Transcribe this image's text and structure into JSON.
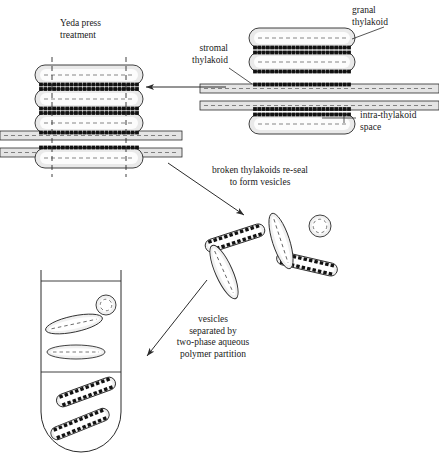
{
  "figure": {
    "background": "#ffffff",
    "stroke": "#2b2b2b",
    "fill_light": "#e9e9e9",
    "fill_lumen": "#fbfbfb",
    "complex_color": "#111111"
  },
  "labels": {
    "yeda_press": "Yeda press\ntreatment",
    "granal_thylakoid": "granal\nthylakoid",
    "stromal_thylakoid": "stromal\nthylakoid",
    "intra_thylakoid_space": "intra-thylakoid\nspace",
    "reseal": "broken thylakoids re-seal\nto form vesicles",
    "partition": "vesicles\nseparated by\ntwo-phase aqueous\npolymer partition"
  },
  "stacks": {
    "intact": {
      "name": "intact-granum-stack",
      "x": 255,
      "granal_discs": [
        {
          "id": "granal-disc-top",
          "cx": 302,
          "cy": 38,
          "w": 106,
          "h": 20
        },
        {
          "id": "granal-disc-second",
          "cx": 302,
          "cy": 62,
          "w": 106,
          "h": 20
        },
        {
          "id": "granal-disc-bottom",
          "cx": 302,
          "cy": 124,
          "w": 106,
          "h": 20
        }
      ],
      "stromal_lamellae": [
        {
          "id": "stromal-lamella-upper",
          "x": 200,
          "y": 84,
          "w": 239,
          "h": 9
        },
        {
          "id": "stromal-lamella-lower",
          "x": 200,
          "y": 101,
          "w": 239,
          "h": 9
        }
      ]
    },
    "pressed": {
      "name": "pressed-granum-stack",
      "shear_lines": [
        52,
        126
      ],
      "granal_discs": [
        {
          "id": "pressed-disc-1",
          "cx": 89,
          "cy": 75,
          "w": 108,
          "h": 20
        },
        {
          "id": "pressed-disc-2",
          "cx": 89,
          "cy": 99,
          "w": 108,
          "h": 20
        },
        {
          "id": "pressed-disc-3",
          "cx": 89,
          "cy": 123,
          "w": 108,
          "h": 20
        },
        {
          "id": "pressed-disc-4",
          "cx": 89,
          "cy": 158,
          "w": 108,
          "h": 20
        }
      ],
      "stromal_lamellae": [
        {
          "id": "pressed-lamella-upper",
          "x": 0,
          "y": 131,
          "w": 182,
          "h": 9
        },
        {
          "id": "pressed-lamella-lower",
          "x": 0,
          "y": 148,
          "w": 182,
          "h": 9
        }
      ]
    }
  },
  "vesicles": {
    "free": [
      {
        "id": "granal-vesicle-a",
        "cx": 235,
        "cy": 238,
        "w": 62,
        "h": 13,
        "rot": -18,
        "type": "granal"
      },
      {
        "id": "granal-vesicle-b",
        "cx": 307,
        "cy": 264,
        "w": 62,
        "h": 13,
        "rot": 13,
        "type": "granal"
      },
      {
        "id": "stromal-vesicle-a",
        "cx": 281,
        "cy": 241,
        "w": 58,
        "h": 17,
        "rot": 72,
        "type": "stromal"
      },
      {
        "id": "stromal-vesicle-b",
        "cx": 224,
        "cy": 272,
        "w": 58,
        "h": 17,
        "rot": 66,
        "type": "stromal"
      },
      {
        "id": "stromal-vesicle-round",
        "cx": 320,
        "cy": 226,
        "r": 11,
        "type": "round"
      }
    ],
    "in_tube_upper": [
      {
        "id": "tube-stromal-vesicle-1",
        "cx": 74,
        "cy": 324,
        "w": 58,
        "h": 16,
        "rot": -12,
        "type": "stromal"
      },
      {
        "id": "tube-stromal-vesicle-2",
        "cx": 76,
        "cy": 352,
        "w": 58,
        "h": 14,
        "rot": 0,
        "type": "stromal"
      },
      {
        "id": "tube-stromal-round",
        "cx": 106,
        "cy": 305,
        "r": 10,
        "type": "round"
      }
    ],
    "in_tube_lower": [
      {
        "id": "tube-granal-vesicle-1",
        "cx": 86,
        "cy": 392,
        "w": 62,
        "h": 13,
        "rot": -20,
        "type": "granal"
      },
      {
        "id": "tube-granal-vesicle-2",
        "cx": 80,
        "cy": 424,
        "w": 62,
        "h": 13,
        "rot": -22,
        "type": "granal"
      }
    ]
  },
  "tube": {
    "name": "centrifuge-tube",
    "x": 41,
    "y": 270,
    "w": 80,
    "h": 182,
    "meniscus_y": 281,
    "phase_boundary_y": 372,
    "upper_phase": "stromal vesicles",
    "lower_phase": "granal vesicles"
  },
  "arrows": [
    {
      "id": "arrow-yeda-press",
      "x1": 226,
      "y1": 87,
      "x2": 144,
      "y2": 87
    },
    {
      "id": "arrow-reseal",
      "x1": 168,
      "y1": 163,
      "x2": 246,
      "y2": 216
    },
    {
      "id": "arrow-partition",
      "x1": 207,
      "y1": 280,
      "x2": 146,
      "y2": 357
    }
  ],
  "leaders": [
    {
      "id": "leader-granal",
      "x1": 384,
      "y1": 26,
      "x2": 352,
      "y2": 38
    },
    {
      "id": "leader-stromal",
      "x1": 228,
      "y1": 67,
      "x2": 250,
      "y2": 83
    },
    {
      "id": "leader-intra",
      "x1": 355,
      "y1": 118,
      "x2": 327,
      "y2": 118
    }
  ]
}
